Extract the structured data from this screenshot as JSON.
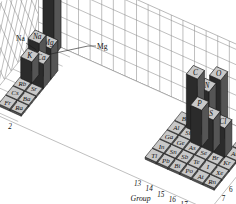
{
  "chart_data": {
    "type": "bar",
    "title": "",
    "subtitle": "",
    "projection": "3d-isometric",
    "xlabel": "Group",
    "ylabel": "Period",
    "zlabel": "Abundance (g)",
    "zscale": "log",
    "zticks": [
      "1",
      "10",
      "10²",
      "10³",
      "10⁴",
      "10⁵"
    ],
    "zticks_sup": [
      {
        "base": "10",
        "exp": "5"
      },
      {
        "base": "10",
        "exp": "4"
      },
      {
        "base": "10",
        "exp": "3"
      },
      {
        "base": "10",
        "exp": "2"
      },
      {
        "base": "10",
        "exp": ""
      },
      {
        "base": "1",
        "exp": ""
      }
    ],
    "zlim": [
      0,
      5
    ],
    "grid": true,
    "legend": "none",
    "group_ticks_left": [
      "1",
      "2"
    ],
    "group_ticks_right": [
      "13",
      "14",
      "15",
      "16",
      "17",
      "18"
    ],
    "period_ticks": [
      "1",
      "2",
      "3",
      "4",
      "5",
      "6",
      "7"
    ],
    "annotations": [
      {
        "text": "Na",
        "target": "Na"
      },
      {
        "text": "Mg",
        "target": "Mg"
      }
    ],
    "categories": [
      "H",
      "He",
      "Li",
      "Be",
      "B",
      "C",
      "N",
      "O",
      "F",
      "Ne",
      "Na",
      "Mg",
      "Al",
      "Si",
      "P",
      "S",
      "Cl",
      "Ar",
      "K",
      "Ca",
      "Ga",
      "Ge",
      "As",
      "Se",
      "Br",
      "Kr",
      "Rb",
      "Sr",
      "In",
      "Sn",
      "Sb",
      "Te",
      "I",
      "Xe",
      "Cs",
      "Ba",
      "Tl",
      "Pb",
      "Bi",
      "Po",
      "At",
      "Rn",
      "Fr",
      "Ra"
    ],
    "values": [
      4.0,
      0.0,
      0.0,
      0.0,
      0.15,
      3.6,
      2.6,
      4.2,
      0.0,
      0.0,
      2.0,
      2.0,
      0.3,
      0.3,
      2.2,
      1.9,
      1.6,
      0.0,
      1.5,
      2.1,
      0.0,
      0.0,
      0.0,
      0.0,
      0.0,
      0.0,
      0.0,
      0.0,
      0.0,
      0.0,
      0.0,
      0.0,
      0.0,
      0.0,
      0.0,
      0.0,
      0.0,
      0.0,
      0.0,
      0.0,
      0.0,
      0.0,
      0.0,
      0.0
    ],
    "elements": [
      {
        "sym": "H",
        "group": 1,
        "period": 1,
        "height": 4.0,
        "raised": true
      },
      {
        "sym": "He",
        "group": 18,
        "period": 1,
        "height": 0.0,
        "raised": false
      },
      {
        "sym": "Na",
        "group": 1,
        "period": 3,
        "height": 2.0,
        "raised": true
      },
      {
        "sym": "Mg",
        "group": 2,
        "period": 3,
        "height": 2.0,
        "raised": true
      },
      {
        "sym": "K",
        "group": 1,
        "period": 4,
        "height": 1.4,
        "raised": true
      },
      {
        "sym": "Ca",
        "group": 2,
        "period": 4,
        "height": 1.6,
        "raised": true
      },
      {
        "sym": "Rb",
        "group": 1,
        "period": 5,
        "height": 0.0,
        "raised": false
      },
      {
        "sym": "Sr",
        "group": 2,
        "period": 5,
        "height": 0.0,
        "raised": false
      },
      {
        "sym": "Cs",
        "group": 1,
        "period": 6,
        "height": 0.0,
        "raised": false
      },
      {
        "sym": "Ba",
        "group": 2,
        "period": 6,
        "height": 0.0,
        "raised": false
      },
      {
        "sym": "Fr",
        "group": 1,
        "period": 7,
        "height": 0.0,
        "raised": false
      },
      {
        "sym": "Ra",
        "group": 2,
        "period": 7,
        "height": 0.0,
        "raised": false
      },
      {
        "sym": "B",
        "group": 13,
        "period": 2,
        "height": 0.15,
        "raised": false
      },
      {
        "sym": "C",
        "group": 14,
        "period": 2,
        "height": 3.5,
        "raised": true
      },
      {
        "sym": "N",
        "group": 15,
        "period": 2,
        "height": 3.0,
        "raised": true
      },
      {
        "sym": "O",
        "group": 16,
        "period": 2,
        "height": 4.1,
        "raised": true
      },
      {
        "sym": "Ne",
        "group": 18,
        "period": 2,
        "height": 0.0,
        "raised": false
      },
      {
        "sym": "Al",
        "group": 13,
        "period": 3,
        "height": 0.0,
        "raised": false
      },
      {
        "sym": "Si",
        "group": 14,
        "period": 3,
        "height": 0.1,
        "raised": false
      },
      {
        "sym": "P",
        "group": 15,
        "period": 3,
        "height": 2.4,
        "raised": true
      },
      {
        "sym": "S",
        "group": 16,
        "period": 3,
        "height": 2.1,
        "raised": true
      },
      {
        "sym": "Cl",
        "group": 17,
        "period": 3,
        "height": 1.9,
        "raised": true
      },
      {
        "sym": "Ar",
        "group": 18,
        "period": 3,
        "height": 0.0,
        "raised": false
      },
      {
        "sym": "Ga",
        "group": 13,
        "period": 4,
        "height": 0.0,
        "raised": false
      },
      {
        "sym": "Ge",
        "group": 14,
        "period": 4,
        "height": 0.0,
        "raised": false
      },
      {
        "sym": "As",
        "group": 15,
        "period": 4,
        "height": 0.0,
        "raised": false
      },
      {
        "sym": "Se",
        "group": 16,
        "period": 4,
        "height": 0.0,
        "raised": false
      },
      {
        "sym": "Br",
        "group": 17,
        "period": 4,
        "height": 0.0,
        "raised": false
      },
      {
        "sym": "Kr",
        "group": 18,
        "period": 4,
        "height": 0.0,
        "raised": false
      },
      {
        "sym": "In",
        "group": 13,
        "period": 5,
        "height": 0.0,
        "raised": false
      },
      {
        "sym": "Sn",
        "group": 14,
        "period": 5,
        "height": 0.0,
        "raised": false
      },
      {
        "sym": "Sb",
        "group": 15,
        "period": 5,
        "height": 0.0,
        "raised": false
      },
      {
        "sym": "Te",
        "group": 16,
        "period": 5,
        "height": 0.0,
        "raised": false
      },
      {
        "sym": "I",
        "group": 17,
        "period": 5,
        "height": 0.0,
        "raised": false
      },
      {
        "sym": "Xe",
        "group": 18,
        "period": 5,
        "height": 0.0,
        "raised": false
      },
      {
        "sym": "Tl",
        "group": 13,
        "period": 6,
        "height": 0.0,
        "raised": false
      },
      {
        "sym": "Pb",
        "group": 14,
        "period": 6,
        "height": 0.0,
        "raised": false
      },
      {
        "sym": "Bi",
        "group": 15,
        "period": 6,
        "height": 0.0,
        "raised": false
      },
      {
        "sym": "Po",
        "group": 16,
        "period": 6,
        "height": 0.0,
        "raised": false
      },
      {
        "sym": "At",
        "group": 17,
        "period": 6,
        "height": 0.0,
        "raised": false
      },
      {
        "sym": "Rn",
        "group": 18,
        "period": 6,
        "height": 0.0,
        "raised": false
      }
    ]
  },
  "colors": {
    "tile_face": "#c8c8c8",
    "bar_top": "#c8c8c8",
    "bar_front": "#2b2b2b",
    "bar_side": "#555555",
    "grid_line": "#8a8a8a",
    "outline": "#1a1a1a",
    "background": "#ffffff",
    "text": "#111111"
  }
}
